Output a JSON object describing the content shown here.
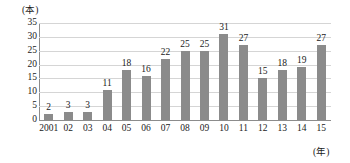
{
  "chart_data": {
    "type": "bar",
    "title": "",
    "xlabel": "(年)",
    "ylabel": "(本)",
    "categories": [
      "2001",
      "02",
      "03",
      "04",
      "05",
      "06",
      "07",
      "08",
      "09",
      "10",
      "11",
      "12",
      "13",
      "14",
      "15"
    ],
    "values": [
      2,
      3,
      3,
      11,
      18,
      16,
      22,
      25,
      25,
      31,
      27,
      15,
      18,
      19,
      27
    ],
    "value_labels": [
      "2",
      "3",
      "3",
      "11",
      "18",
      "16",
      "22",
      "25",
      "25",
      "31",
      "27",
      "15",
      "18",
      "19",
      "27"
    ],
    "ylim": [
      0,
      35
    ],
    "yticks": [
      0,
      5,
      10,
      15,
      20,
      25,
      30,
      35
    ],
    "ytick_labels": [
      "0",
      "5",
      "10",
      "15",
      "20",
      "25",
      "30",
      "35"
    ],
    "grid": true,
    "legend": null,
    "bar_color": "#8b8b8b",
    "grid_color": "#d5d5d5",
    "axis_color": "#8c8c8c",
    "text_color": "#1a1a1a"
  }
}
